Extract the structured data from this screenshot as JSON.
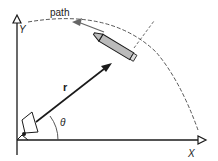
{
  "diagram": {
    "labels": {
      "path": "path",
      "y_axis": "Y",
      "x_axis": "X",
      "vector": "r",
      "angle": "θ"
    },
    "elements": {
      "origin": "radar-dish",
      "object": "rocket",
      "trajectory": "dashed-arc",
      "line_of_sight": "dashed-line"
    },
    "colors": {
      "line": "#1a1a1a",
      "rocket_body": "#bbbbbb",
      "dashed": "#444444"
    }
  }
}
